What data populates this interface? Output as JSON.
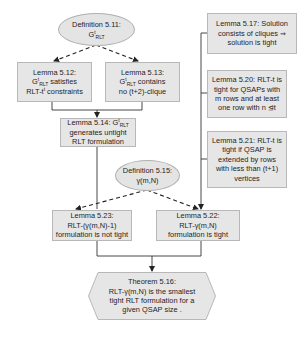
{
  "diagram": {
    "colors": {
      "node_fill": "#e6e6e6",
      "node_border": "#b8b8b8",
      "edge": "#333333"
    },
    "nodes": [
      {
        "id": "def511",
        "shape": "ellipse",
        "lines": [
          "Definition 5.11:",
          "GᵗRLT"
        ],
        "label_main": "Definition 5.11:",
        "label_sub_base": "G",
        "label_sub_sup": "t",
        "label_sub_sub": "RLT"
      },
      {
        "id": "lem512",
        "shape": "rect",
        "lines": [
          "Lemma 5.12:",
          "GᵗRLT satisfies",
          "RLT-tᵗ constraints"
        ],
        "line1": "Lemma 5.12:",
        "line2_base": "G",
        "line2_sup": "t",
        "line2_sub": "RLT",
        "line2_rest": " satisfies",
        "line3_base": "RLT-t",
        "line3_sup": "t",
        "line3_rest": " constraints"
      },
      {
        "id": "lem513",
        "shape": "rect",
        "lines": [
          "Lemma 5.13:",
          "GᵗRLT contains",
          "no (t+2)-clique"
        ],
        "line1": "Lemma 5.13:",
        "line2_base": "G",
        "line2_sup": "t",
        "line2_sub": "RLT",
        "line2_rest": " contains",
        "line3": "no (t+2)-clique"
      },
      {
        "id": "lem514",
        "shape": "rect",
        "lines": [
          "Lemma 5.14: GᵗRLT",
          "generates untight",
          "RLT formulation"
        ],
        "line1_pre": "Lemma 5.14: G",
        "line1_sup": "t",
        "line1_sub": "RLT",
        "line2": "generates untight",
        "line3": "RLT formulation"
      },
      {
        "id": "def515",
        "shape": "ellipse",
        "lines": [
          "Definition 5.15:",
          "γ(m,N)"
        ],
        "line1": "Definition 5.15:",
        "line2": "γ(m,N)"
      },
      {
        "id": "lem523",
        "shape": "rect",
        "lines": [
          "Lemma 5.23:",
          "RLT-(γ(m,N)-1)",
          "formulation is not tight"
        ],
        "line1": "Lemma 5.23:",
        "line2": "RLT-(γ(m,N)-1)",
        "line3": "formulation is not tight"
      },
      {
        "id": "lem522",
        "shape": "rect",
        "lines": [
          "Lemma 5.22:",
          "RLT-γ(m,N)",
          "formulation is tight"
        ],
        "line1": "Lemma 5.22:",
        "line2": "RLT-γ(m,N)",
        "line3": "formulation is tight"
      },
      {
        "id": "lem517",
        "shape": "rect",
        "lines": [
          "Lemma 5.17: Solution",
          "consists of cliques ⇒",
          "solution is tight"
        ],
        "line1": "Lemma 5.17: Solution",
        "line2": "consists of cliques ⇒",
        "line3": "solution is tight"
      },
      {
        "id": "lem520",
        "shape": "rect",
        "lines": [
          "Lemma 5.20: RLT-t is",
          "tight for QSAPs with",
          "m rows and at least",
          "one row with n ⊴t"
        ],
        "line1": "Lemma 5.20: RLT-t is",
        "line2": "tight for QSAPs with",
        "line3": "m rows and at least",
        "line4": "one row with n ⊴t"
      },
      {
        "id": "lem521",
        "shape": "rect",
        "lines": [
          "Lemma 5.21: RLT-t is",
          "tight if QSAP is",
          "extended by rows",
          "with less than  (t+1)",
          "vertices"
        ],
        "line1": "Lemma 5.21: RLT-t is",
        "line2": "tight if QSAP is",
        "line3": "extended by rows",
        "line4": "with less than  (t+1)",
        "line5": "vertices"
      },
      {
        "id": "thm516",
        "shape": "hexagon",
        "lines": [
          "Theorem 5.16:",
          "RLT-γ(m,N) is the smallest",
          "tight RLT formulation for a",
          "given QSAP size ."
        ],
        "line1": "Theorem 5.16:",
        "line2": "RLT-γ(m,N) is the smallest",
        "line3": "tight RLT formulation for a",
        "line4": "given QSAP size ."
      }
    ],
    "edges": [
      {
        "from": "def511",
        "to": "lem512",
        "style": "dashed"
      },
      {
        "from": "def511",
        "to": "lem513",
        "style": "dashed"
      },
      {
        "from": "lem512",
        "to": "lem514",
        "style": "solid"
      },
      {
        "from": "lem513",
        "to": "lem514",
        "style": "solid"
      },
      {
        "from": "lem514",
        "to": "lem523",
        "style": "solid"
      },
      {
        "from": "def515",
        "to": "lem523",
        "style": "dashed"
      },
      {
        "from": "def515",
        "to": "lem522",
        "style": "dashed"
      },
      {
        "from": "lem517",
        "to": "lem522",
        "style": "solid"
      },
      {
        "from": "lem520",
        "to": "lem522",
        "style": "solid"
      },
      {
        "from": "lem521",
        "to": "lem522",
        "style": "solid"
      },
      {
        "from": "lem523",
        "to": "thm516",
        "style": "solid"
      },
      {
        "from": "lem522",
        "to": "thm516",
        "style": "solid"
      }
    ]
  }
}
